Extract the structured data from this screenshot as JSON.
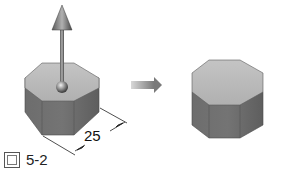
{
  "figure": {
    "left_model": {
      "shape": "octagonal prism",
      "has_extrude_arrow": true,
      "dimension_value": "25"
    },
    "transition_arrow": "right-arrow",
    "right_model": {
      "shape": "octagonal prism"
    },
    "caption": {
      "prefix_icon": "figure-glyph-icon",
      "label": "5-2"
    },
    "colors": {
      "top_face": "#b8b8b8",
      "side_face": "#6a6a6a",
      "side_face_dark": "#585858",
      "arrow": "#8a8a8a",
      "edge": "#4a4a4a"
    }
  }
}
